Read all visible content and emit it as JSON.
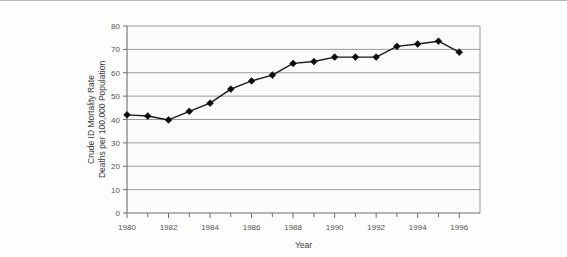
{
  "figure": {
    "background_color": "#fdfdfd",
    "border_color": "#b8b8b8"
  },
  "chart_data": {
    "type": "line",
    "title": "",
    "xlabel": "Year",
    "ylabel": "Crude ID Mortality Rate\nDeaths per 100,000 Population",
    "ylabel_line1": "Crude ID Mortality Rate",
    "ylabel_line2": "Deaths per 100,000 Population",
    "x": [
      1980,
      1981,
      1982,
      1983,
      1984,
      1985,
      1986,
      1987,
      1988,
      1989,
      1990,
      1991,
      1992,
      1993,
      1994,
      1995,
      1996
    ],
    "values": [
      42.0,
      41.5,
      39.8,
      43.5,
      47.0,
      53.0,
      56.5,
      59.0,
      64.0,
      64.8,
      66.7,
      66.7,
      66.7,
      71.3,
      72.3,
      73.5,
      68.8
    ],
    "series": [
      {
        "name": "Crude ID Mortality Rate",
        "values": [
          42.0,
          41.5,
          39.8,
          43.5,
          47.0,
          53.0,
          56.5,
          59.0,
          64.0,
          64.8,
          66.7,
          66.7,
          66.7,
          71.3,
          72.3,
          73.5,
          68.8
        ]
      }
    ],
    "xlim": [
      1980,
      1997
    ],
    "ylim": [
      0,
      80
    ],
    "ytick_labels": [
      "0",
      "10",
      "20",
      "30",
      "40",
      "50",
      "60",
      "70",
      "80"
    ],
    "ytick_values": [
      0,
      10,
      20,
      30,
      40,
      50,
      60,
      70,
      80
    ],
    "xtick_labels": [
      "1980",
      "1982",
      "1984",
      "1986",
      "1988",
      "1990",
      "1992",
      "1994",
      "1996"
    ],
    "xtick_values": [
      1980,
      1982,
      1984,
      1986,
      1988,
      1990,
      1992,
      1994,
      1996
    ],
    "xminor_values": [
      1981,
      1983,
      1985,
      1987,
      1989,
      1991,
      1993,
      1995
    ],
    "grid": "horizontal",
    "legend": "none",
    "line_color": "#1a1a1a",
    "marker": "diamond",
    "marker_color": "#0d0d0d",
    "gridline_color": "#9a9a9a",
    "plot_background": "#fbfbfb"
  }
}
